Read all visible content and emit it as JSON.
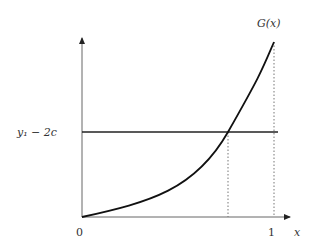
{
  "diagram": {
    "curve_label": "G(x)",
    "level_label": "y₁ − 2c",
    "x_axis_label": "x",
    "origin_label": "0",
    "x_tick_one_label": "1",
    "colors": {
      "axis": "#555555",
      "curve": "#111111",
      "level_line": "#222222",
      "dotted": "#777777",
      "text": "#333333"
    }
  }
}
